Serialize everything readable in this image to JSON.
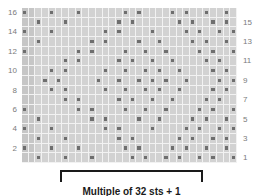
{
  "chart": {
    "columns": 32,
    "rows": 16,
    "colors": {
      "grid_background": "#d2d2d2",
      "shaded_cell": "#c6c6c6",
      "gridline": "#f2f2f2",
      "symbol": "#6e6e6e",
      "label_text": "#7b7b7b",
      "bracket": "#1a1a1a",
      "caption_text": "#1a1a1a"
    },
    "left_row_labels": [
      "16",
      "",
      "14",
      "",
      "12",
      "",
      "10",
      "",
      "8",
      "",
      "6",
      "",
      "4",
      "",
      "2",
      ""
    ],
    "right_row_labels": [
      "",
      "15",
      "",
      "13",
      "",
      "11",
      "",
      "9",
      "",
      "7",
      "",
      "5",
      "",
      "3",
      "",
      "1"
    ],
    "symbol_name": "purl-stitch-dot",
    "rows_data": [
      {
        "row": 16,
        "dots": [
          0,
          4,
          8,
          15,
          17,
          22,
          24,
          27,
          30,
          32
        ]
      },
      {
        "row": 15,
        "dots": [
          2,
          6,
          14,
          16,
          23,
          25,
          28,
          30
        ]
      },
      {
        "row": 14,
        "dots": [
          0,
          4,
          12,
          14,
          19,
          24,
          26,
          29,
          31
        ]
      },
      {
        "row": 13,
        "dots": [
          2,
          10,
          12,
          17,
          20,
          25,
          27,
          30
        ]
      },
      {
        "row": 12,
        "dots": [
          0,
          8,
          10,
          15,
          18,
          21,
          26,
          28,
          31
        ]
      },
      {
        "row": 11,
        "dots": [
          6,
          8,
          14,
          16,
          19,
          22,
          27,
          29
        ]
      },
      {
        "row": 10,
        "dots": [
          4,
          6,
          12,
          15,
          18,
          20,
          23,
          28,
          30
        ]
      },
      {
        "row": 9,
        "dots": [
          3,
          5,
          11,
          14,
          17,
          19,
          21,
          24,
          29,
          31
        ]
      },
      {
        "row": 8,
        "dots": [
          4,
          6,
          12,
          15,
          18,
          20,
          23,
          28,
          30
        ]
      },
      {
        "row": 7,
        "dots": [
          6,
          8,
          14,
          16,
          19,
          22,
          27,
          29
        ]
      },
      {
        "row": 6,
        "dots": [
          0,
          8,
          10,
          15,
          18,
          21,
          26,
          28,
          31
        ]
      },
      {
        "row": 5,
        "dots": [
          2,
          10,
          12,
          17,
          20,
          25,
          27,
          30
        ]
      },
      {
        "row": 4,
        "dots": [
          0,
          4,
          12,
          14,
          19,
          24,
          26,
          29,
          31
        ]
      },
      {
        "row": 3,
        "dots": [
          2,
          6,
          14,
          16,
          23,
          25,
          28,
          30
        ]
      },
      {
        "row": 2,
        "dots": [
          0,
          4,
          8,
          15,
          17,
          22,
          24,
          27,
          30,
          32
        ]
      },
      {
        "row": 1,
        "dots": [
          2,
          6,
          10,
          16,
          18,
          21,
          23,
          26,
          28,
          31
        ]
      }
    ],
    "shaded_columns": [
      0,
      1
    ]
  },
  "repeat": {
    "bracket_name": "pattern-repeat-bracket"
  },
  "caption": {
    "text": "Multiple of 32 sts + 1"
  }
}
